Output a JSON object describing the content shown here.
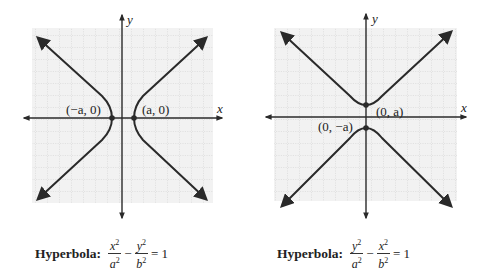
{
  "figures": [
    {
      "id": "left",
      "orientation": "horizontal",
      "axis_labels": {
        "x": "x",
        "y": "y"
      },
      "vertex_labels": [
        "(−a, 0)",
        "(a, 0)"
      ],
      "caption": {
        "label": "Hyperbola:",
        "term1": {
          "num": "x",
          "den": "a"
        },
        "minus": "−",
        "term2": {
          "num": "y",
          "den": "b"
        },
        "exp": "2",
        "rhs": "= 1"
      }
    },
    {
      "id": "right",
      "orientation": "vertical",
      "axis_labels": {
        "x": "x",
        "y": "y"
      },
      "vertex_labels": [
        "(0, a)",
        "(0, −a)"
      ],
      "caption": {
        "label": "Hyperbola:",
        "term1": {
          "num": "y",
          "den": "a"
        },
        "minus": "−",
        "term2": {
          "num": "x",
          "den": "b"
        },
        "exp": "2",
        "rhs": "= 1"
      }
    }
  ],
  "colors": {
    "curve": "#2a2a2a",
    "grid": "#b8b8b8",
    "grid_bg": "#f2f2f2"
  }
}
